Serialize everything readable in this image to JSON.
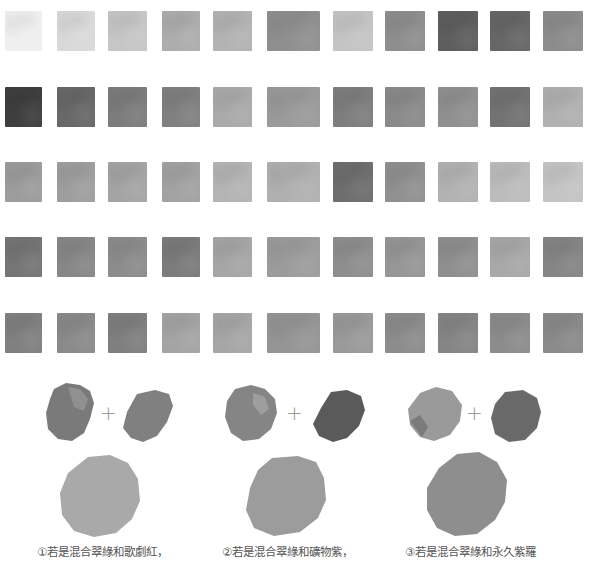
{
  "swatch_grid": {
    "rows": 5,
    "columns": 11,
    "column_x": [
      5,
      57,
      108,
      162,
      213,
      267,
      333,
      385,
      438,
      490,
      543
    ],
    "column_w": [
      37,
      38,
      39,
      38,
      39,
      53,
      40,
      40,
      40,
      40,
      40
    ],
    "row_y": [
      11,
      87,
      162,
      237,
      313
    ],
    "row_h": 40,
    "gray_levels": [
      [
        "#efefef",
        "#d9d9d9",
        "#c6c6c6",
        "#adadad",
        "#b3b3b3",
        "#8f8f8f",
        "#c4c4c4",
        "#8e8e8e",
        "#5e5e5e",
        "#666666",
        "#8c8c8c"
      ],
      [
        "#3e3e3e",
        "#686868",
        "#7c7c7c",
        "#808080",
        "#aaaaaa",
        "#9a9a9a",
        "#7e7e7e",
        "#8a8a8a",
        "#909090",
        "#727272",
        "#b0b0b0"
      ],
      [
        "#9c9c9c",
        "#9e9e9e",
        "#a4a4a4",
        "#a2a2a2",
        "#b4b4b4",
        "#b0b0b0",
        "#6e6e6e",
        "#909090",
        "#b2b2b2",
        "#bcbcbc",
        "#c4c4c4"
      ],
      [
        "#757575",
        "#878787",
        "#8c8c8c",
        "#7b7b7b",
        "#a6a6a6",
        "#9c9c9c",
        "#8e8e8e",
        "#969696",
        "#8f8f8f",
        "#a8a8a8",
        "#858585"
      ],
      [
        "#808080",
        "#8a8a8a",
        "#7f7f7f",
        "#a4a4a4",
        "#a6a6a6",
        "#959595",
        "#9a9a9a",
        "#8c8c8c",
        "#858585",
        "#8c8c8c",
        "#8a8a8a"
      ]
    ]
  },
  "mix_examples": [
    {
      "caption": "①若是混合翠綠和歌劇紅，",
      "plus_symbol": "+",
      "left_color": "#7a7a7a",
      "right_color": "#808080",
      "result_color": "#a9a9a9"
    },
    {
      "caption": "②若是混合翠綠和礦物紫，",
      "plus_symbol": "+",
      "left_color": "#858585",
      "right_color": "#5a5a5a",
      "result_color": "#9c9c9c"
    },
    {
      "caption": "③若是混合翠綠和永久紫羅",
      "plus_symbol": "+",
      "left_color": "#9a9a9a",
      "right_color": "#6a6a6a",
      "result_color": "#8e8e8e"
    }
  ]
}
